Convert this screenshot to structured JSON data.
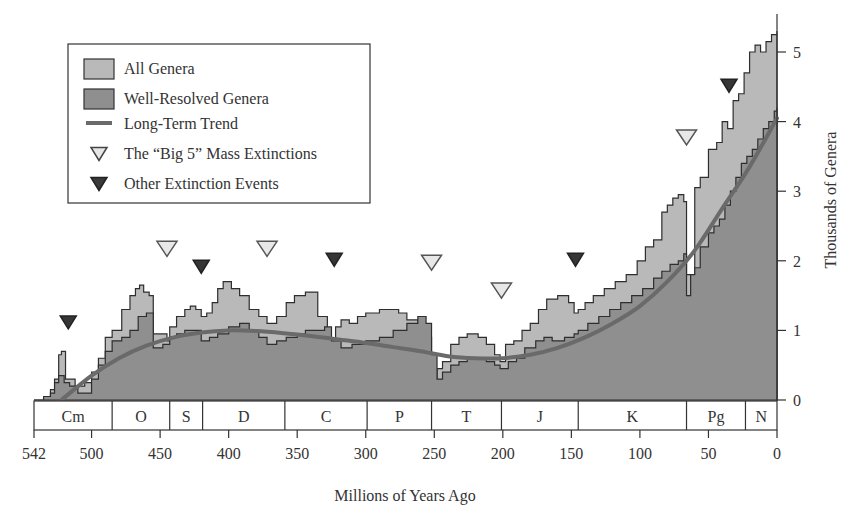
{
  "chart_data": {
    "type": "area",
    "title": "",
    "xlabel": "Millions of Years Ago",
    "ylabel": "Thousands of Genera",
    "xlim": [
      542,
      0
    ],
    "ylim": [
      0,
      5.4
    ],
    "x_ticks": [
      542,
      500,
      450,
      400,
      350,
      300,
      250,
      200,
      150,
      100,
      50,
      0
    ],
    "y_ticks": [
      0,
      1,
      2,
      3,
      4,
      5
    ],
    "grid": false,
    "legend_position": "upper-left",
    "legend": [
      {
        "label": "All Genera",
        "kind": "swatch",
        "color": "#b9b9b9"
      },
      {
        "label": "Well-Resolved Genera",
        "kind": "swatch",
        "color": "#8f8f8f"
      },
      {
        "label": "Long-Term Trend",
        "kind": "line",
        "color": "#6a6a6a"
      },
      {
        "label": "The “Big 5” Mass Extinctions",
        "kind": "open-triangle",
        "color": "#e6e6e6"
      },
      {
        "label": "Other Extinction Events",
        "kind": "filled-triangle",
        "color": "#3a3a3a"
      }
    ],
    "periods": [
      {
        "label": "Cm",
        "start": 542,
        "end": 485
      },
      {
        "label": "O",
        "start": 485,
        "end": 443
      },
      {
        "label": "S",
        "start": 443,
        "end": 419
      },
      {
        "label": "D",
        "start": 419,
        "end": 359
      },
      {
        "label": "C",
        "start": 359,
        "end": 299
      },
      {
        "label": "P",
        "start": 299,
        "end": 252
      },
      {
        "label": "T",
        "start": 252,
        "end": 201
      },
      {
        "label": "J",
        "start": 201,
        "end": 145
      },
      {
        "label": "K",
        "start": 145,
        "end": 66
      },
      {
        "label": "Pg",
        "start": 66,
        "end": 23
      },
      {
        "label": "N",
        "start": 23,
        "end": 0
      }
    ],
    "series": [
      {
        "name": "All Genera",
        "x": [
          542,
          535,
          530,
          527,
          524,
          522,
          519,
          516,
          512,
          505,
          500,
          495,
          490,
          485,
          478,
          472,
          468,
          465,
          462,
          458,
          455,
          448,
          445,
          443,
          438,
          432,
          428,
          424,
          420,
          416,
          412,
          408,
          404,
          398,
          392,
          385,
          378,
          372,
          365,
          358,
          352,
          344,
          335,
          328,
          322,
          318,
          312,
          306,
          300,
          296,
          290,
          282,
          276,
          270,
          262,
          256,
          252,
          248,
          244,
          238,
          232,
          226,
          218,
          212,
          206,
          202,
          198,
          192,
          186,
          180,
          174,
          168,
          160,
          152,
          148,
          145,
          140,
          134,
          126,
          118,
          110,
          102,
          96,
          90,
          84,
          80,
          76,
          72,
          68,
          66,
          63,
          60,
          56,
          50,
          44,
          40,
          36,
          32,
          28,
          24,
          20,
          16,
          12,
          8,
          4,
          0
        ],
        "values": [
          0.0,
          0.05,
          0.15,
          0.3,
          0.65,
          0.7,
          0.3,
          0.3,
          0.2,
          0.25,
          0.4,
          0.6,
          0.9,
          1.0,
          1.3,
          1.5,
          1.6,
          1.65,
          1.55,
          1.5,
          0.95,
          0.95,
          0.85,
          1.05,
          1.2,
          1.3,
          1.35,
          1.3,
          1.2,
          1.25,
          1.4,
          1.6,
          1.7,
          1.6,
          1.5,
          1.3,
          1.2,
          1.1,
          1.2,
          1.4,
          1.5,
          1.55,
          1.2,
          0.85,
          1.05,
          1.15,
          1.1,
          1.2,
          1.25,
          1.25,
          1.3,
          1.3,
          1.25,
          1.15,
          0.95,
          0.9,
          0.3,
          0.45,
          0.55,
          0.8,
          0.9,
          0.95,
          0.9,
          0.8,
          0.65,
          0.55,
          0.8,
          0.85,
          1.0,
          1.1,
          1.3,
          1.45,
          1.5,
          1.4,
          1.25,
          1.3,
          1.4,
          1.5,
          1.6,
          1.7,
          1.8,
          2.0,
          2.2,
          2.3,
          2.7,
          2.8,
          2.9,
          2.95,
          2.85,
          1.8,
          1.75,
          3.05,
          3.2,
          3.6,
          3.7,
          4.0,
          3.9,
          4.3,
          4.4,
          4.7,
          5.0,
          5.1,
          5.0,
          5.15,
          5.25,
          5.3
        ],
        "color": "#b9b9b9"
      },
      {
        "name": "Well-Resolved Genera",
        "x": [
          542,
          535,
          530,
          527,
          524,
          520,
          516,
          510,
          500,
          495,
          490,
          485,
          478,
          472,
          466,
          460,
          455,
          448,
          443,
          438,
          432,
          426,
          420,
          414,
          408,
          400,
          392,
          385,
          378,
          372,
          365,
          358,
          350,
          344,
          335,
          330,
          325,
          318,
          310,
          300,
          290,
          280,
          270,
          262,
          256,
          252,
          248,
          244,
          238,
          232,
          226,
          218,
          212,
          206,
          202,
          196,
          190,
          184,
          176,
          170,
          164,
          155,
          148,
          145,
          138,
          130,
          122,
          114,
          106,
          98,
          90,
          84,
          78,
          72,
          68,
          66,
          63,
          60,
          56,
          50,
          46,
          42,
          38,
          34,
          30,
          26,
          22,
          18,
          14,
          10,
          6,
          2,
          0
        ],
        "values": [
          0.0,
          0.05,
          0.1,
          0.25,
          0.35,
          0.25,
          0.2,
          0.1,
          0.3,
          0.5,
          0.7,
          0.85,
          0.9,
          1.0,
          1.2,
          1.25,
          0.75,
          0.8,
          0.9,
          0.95,
          1.0,
          1.0,
          0.85,
          0.9,
          0.95,
          1.05,
          1.1,
          1.0,
          0.9,
          0.8,
          0.85,
          0.9,
          0.95,
          1.0,
          1.0,
          1.05,
          0.85,
          0.75,
          0.8,
          0.85,
          0.9,
          1.0,
          1.1,
          1.2,
          1.1,
          0.65,
          0.3,
          0.4,
          0.5,
          0.55,
          0.6,
          0.6,
          0.55,
          0.5,
          0.45,
          0.55,
          0.6,
          0.75,
          0.85,
          0.9,
          0.85,
          0.9,
          0.95,
          1.0,
          1.1,
          1.2,
          1.3,
          1.4,
          1.5,
          1.6,
          1.75,
          1.85,
          1.95,
          2.0,
          2.1,
          1.5,
          1.8,
          1.9,
          2.2,
          2.4,
          2.5,
          2.6,
          2.8,
          3.0,
          3.2,
          3.4,
          3.5,
          3.6,
          3.75,
          3.9,
          4.0,
          4.15,
          4.2
        ],
        "color": "#8f8f8f"
      },
      {
        "name": "Long-Term Trend",
        "x": [
          522,
          500,
          480,
          460,
          440,
          420,
          400,
          380,
          360,
          340,
          320,
          300,
          280,
          260,
          240,
          220,
          200,
          180,
          160,
          140,
          120,
          100,
          80,
          60,
          40,
          20,
          0
        ],
        "values": [
          0.0,
          0.35,
          0.6,
          0.78,
          0.9,
          0.97,
          1.0,
          0.99,
          0.96,
          0.92,
          0.87,
          0.82,
          0.76,
          0.7,
          0.63,
          0.6,
          0.6,
          0.65,
          0.75,
          0.9,
          1.1,
          1.35,
          1.7,
          2.15,
          2.75,
          3.35,
          4.05
        ],
        "color": "#6a6a6a"
      }
    ],
    "markers": {
      "big5": [
        {
          "age": 445,
          "value": 2.0
        },
        {
          "age": 372,
          "value": 2.0
        },
        {
          "age": 252,
          "value": 1.8
        },
        {
          "age": 201,
          "value": 1.4
        },
        {
          "age": 66,
          "value": 3.6
        }
      ],
      "other": [
        {
          "age": 517,
          "value": 1.0
        },
        {
          "age": 420,
          "value": 1.8
        },
        {
          "age": 323,
          "value": 1.9
        },
        {
          "age": 147,
          "value": 1.9
        },
        {
          "age": 35,
          "value": 4.4
        }
      ]
    }
  }
}
